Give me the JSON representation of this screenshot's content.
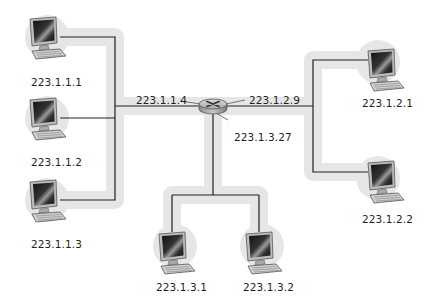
{
  "diagram": {
    "type": "network-topology",
    "router": {
      "icon": "router-icon",
      "interfaces": [
        {
          "id": "if-left",
          "address": "223.1.1.4"
        },
        {
          "id": "if-right",
          "address": "223.1.2.9"
        },
        {
          "id": "if-bottom",
          "address": "223.1.3.27"
        }
      ]
    },
    "subnets": [
      {
        "name": "subnet-223.1.1",
        "hosts": [
          {
            "address": "223.1.1.1"
          },
          {
            "address": "223.1.1.2"
          },
          {
            "address": "223.1.1.3"
          }
        ]
      },
      {
        "name": "subnet-223.1.2",
        "hosts": [
          {
            "address": "223.1.2.1"
          },
          {
            "address": "223.1.2.2"
          }
        ]
      },
      {
        "name": "subnet-223.1.3",
        "hosts": [
          {
            "address": "223.1.3.1"
          },
          {
            "address": "223.1.3.2"
          }
        ]
      }
    ],
    "colors": {
      "subnet_highlight": "#e6e6e6",
      "link": "#231f20",
      "text": "#231f20"
    }
  }
}
